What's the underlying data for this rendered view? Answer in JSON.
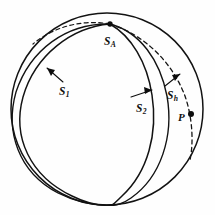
{
  "figure": {
    "background_color": "#fefefe",
    "stroke_color": "#121212",
    "width": 215,
    "height": 215
  },
  "sphere": {
    "name": "outer-sphere-outline",
    "center_x": 107,
    "center_y": 109,
    "radius": 96,
    "stroke_width": 1.5
  },
  "labels": {
    "s_a": {
      "base": "S",
      "sub": "A"
    },
    "s_1": {
      "base": "S",
      "sub": "1"
    },
    "s_2": {
      "base": "S",
      "sub": "2"
    },
    "s_h": {
      "base": "S",
      "sub": "h"
    },
    "p": {
      "base": "P",
      "sub": ""
    }
  },
  "points": [
    {
      "name": "intersection-point-sa",
      "label": "S_A",
      "x": 110,
      "y": 24,
      "radius": 2.6
    },
    {
      "name": "point-p",
      "label": "P",
      "x": 191,
      "y": 114,
      "radius": 2.9
    }
  ],
  "curves": [
    {
      "name": "great-circle-s1",
      "style": "solid",
      "label": "S_1"
    },
    {
      "name": "great-circle-s2",
      "style": "solid",
      "label": "S_2"
    },
    {
      "name": "great-circle-sh",
      "style": "dashed",
      "label": "S_h"
    }
  ],
  "annotations": [
    {
      "name": "leader-s1",
      "label": "S_1",
      "direction": "up-left"
    },
    {
      "name": "leader-s2",
      "label": "S_2",
      "direction": "up-right"
    },
    {
      "name": "leader-sh",
      "label": "S_h",
      "direction": "up-right"
    }
  ]
}
